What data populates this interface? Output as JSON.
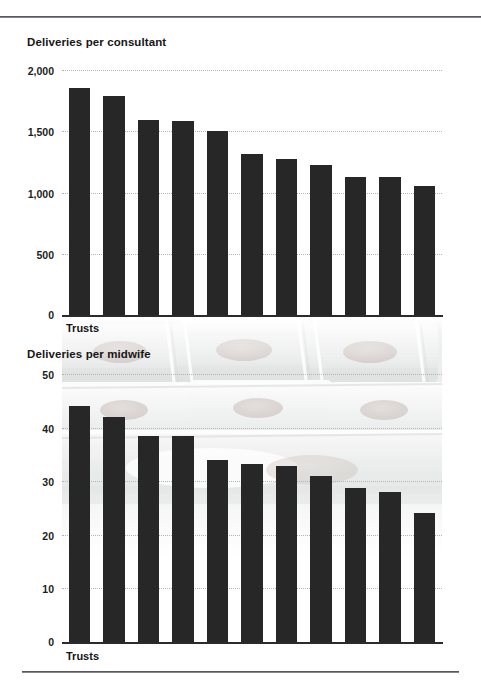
{
  "page": {
    "background_color": "#ffffff",
    "rule_color": "#55585c",
    "bar_color": "#272727",
    "gridline_color": "#b4b4b4"
  },
  "charts": [
    {
      "id": "deliveries-per-consultant",
      "title": "Deliveries per consultant",
      "xlabel": "Trusts",
      "ytick_labels": [
        "2,000",
        "1,500",
        "1,000",
        "500",
        "0"
      ]
    },
    {
      "id": "deliveries-per-midwife",
      "title": "Deliveries per midwife",
      "xlabel": "Trusts",
      "ytick_labels": [
        "50",
        "40",
        "30",
        "20",
        "10",
        "0"
      ],
      "background_image": "neonatal-incubators-photo"
    }
  ],
  "chart_data": [
    {
      "type": "bar",
      "id": "deliveries-per-consultant",
      "title": "Deliveries per consultant",
      "xlabel": "Trusts",
      "ylabel": "",
      "ylim": [
        0,
        2000
      ],
      "yticks": [
        0,
        500,
        1000,
        1500,
        2000
      ],
      "ytick_labels": [
        "0",
        "500",
        "1,000",
        "1,500",
        "2,000"
      ],
      "grid": "horizontal-dotted",
      "legend": "none",
      "categories": [
        "Trust 1",
        "Trust 2",
        "Trust 3",
        "Trust 4",
        "Trust 5",
        "Trust 6",
        "Trust 7",
        "Trust 8",
        "Trust 9",
        "Trust 10",
        "Trust 11"
      ],
      "values": [
        1850,
        1790,
        1590,
        1585,
        1500,
        1315,
        1275,
        1225,
        1130,
        1125,
        1050
      ],
      "bar_color": "#272727"
    },
    {
      "type": "bar",
      "id": "deliveries-per-midwife",
      "title": "Deliveries per midwife",
      "xlabel": "Trusts",
      "ylabel": "",
      "ylim": [
        0,
        50
      ],
      "yticks": [
        0,
        10,
        20,
        30,
        40,
        50
      ],
      "ytick_labels": [
        "0",
        "10",
        "20",
        "30",
        "40",
        "50"
      ],
      "grid": "horizontal-dotted",
      "legend": "none",
      "categories": [
        "Trust 1",
        "Trust 2",
        "Trust 3",
        "Trust 4",
        "Trust 5",
        "Trust 6",
        "Trust 7",
        "Trust 8",
        "Trust 9",
        "Trust 10",
        "Trust 11"
      ],
      "values": [
        44,
        42,
        38.5,
        38.4,
        34,
        33.3,
        32.8,
        31,
        28.7,
        28,
        24
      ],
      "bar_color": "#272727"
    }
  ]
}
